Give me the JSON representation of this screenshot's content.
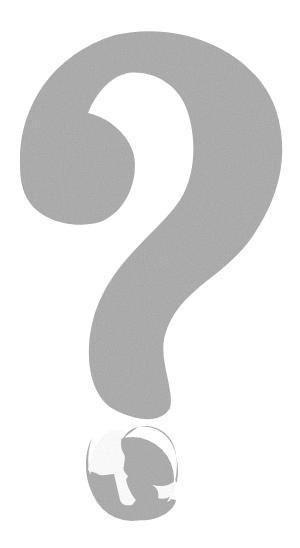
{
  "image": {
    "description": "Large gray question mark with a circular logo showing a silhouette of a person reading a book",
    "background_color": "#ffffff",
    "fill_color": "#a8a8a8"
  },
  "question_mark": {
    "icon": "question-mark-icon",
    "label": "?"
  },
  "logo": {
    "icon": "reader-globe-icon"
  }
}
